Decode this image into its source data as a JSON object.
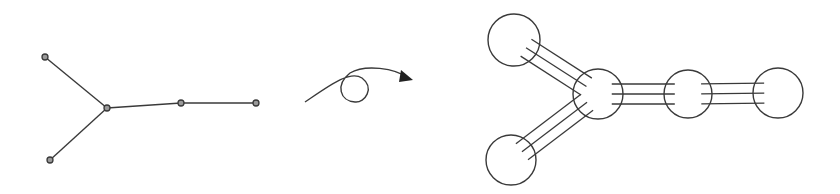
{
  "diagram": {
    "stroke_color": "#3a3a3a",
    "background": "#ffffff",
    "left_graph": {
      "nodes": [
        {
          "id": "a",
          "x": 45,
          "y": 57
        },
        {
          "id": "b",
          "x": 50,
          "y": 160
        },
        {
          "id": "c",
          "x": 107,
          "y": 108
        },
        {
          "id": "d",
          "x": 181,
          "y": 103
        },
        {
          "id": "e",
          "x": 256,
          "y": 103
        }
      ],
      "edges": [
        [
          "a",
          "c"
        ],
        [
          "b",
          "c"
        ],
        [
          "c",
          "d"
        ],
        [
          "d",
          "e"
        ]
      ],
      "node_radius": 3
    },
    "transition_arrow": {
      "path": "M305,102 C330,85 350,70 362,78 C375,88 365,103 355,102 C340,101 335,85 350,73 C365,64 395,68 408,78",
      "head": {
        "x": 413,
        "y": 80
      }
    },
    "right_graph": {
      "nodes": [
        {
          "id": "a",
          "x": 514,
          "y": 40,
          "r": 26
        },
        {
          "id": "b",
          "x": 511,
          "y": 160,
          "r": 25
        },
        {
          "id": "c",
          "x": 598,
          "y": 94,
          "r": 25
        },
        {
          "id": "d",
          "x": 688,
          "y": 94,
          "r": 24
        },
        {
          "id": "e",
          "x": 778,
          "y": 93,
          "r": 25
        }
      ],
      "edges": [
        [
          "a",
          "c"
        ],
        [
          "b",
          "c"
        ],
        [
          "c",
          "d"
        ],
        [
          "d",
          "e"
        ]
      ],
      "bond_lines": 3,
      "bond_spacing": 10
    }
  }
}
